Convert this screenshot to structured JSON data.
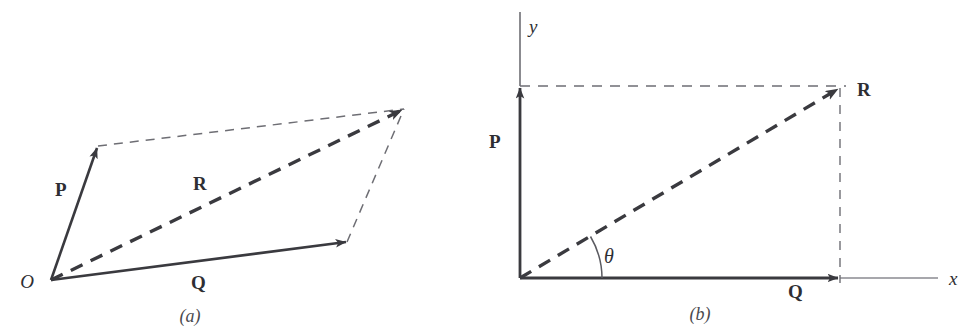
{
  "figure": {
    "background_color": "#ffffff",
    "ink_color": "#3a3a3f",
    "thin_ink_color": "#6e6e74",
    "width": 978,
    "height": 334
  },
  "panels": [
    {
      "id": "panel-a",
      "caption": "(a)",
      "caption_pos": {
        "x": 190,
        "y": 322
      },
      "description": "parallelogram law of vector addition",
      "origin_label": "O",
      "origin_label_pos": {
        "x": 27,
        "y": 288
      },
      "origin_point": {
        "x": 51,
        "y": 280
      },
      "vectors": [
        {
          "name": "P",
          "label": "P",
          "label_pos": {
            "x": 55,
            "y": 196
          },
          "style": "solid",
          "from": {
            "x": 51,
            "y": 280
          },
          "to": {
            "x": 98,
            "y": 146
          }
        },
        {
          "name": "Q",
          "label": "Q",
          "label_pos": {
            "x": 191,
            "y": 289
          },
          "style": "solid",
          "from": {
            "x": 51,
            "y": 280
          },
          "to": {
            "x": 347,
            "y": 242
          }
        },
        {
          "name": "R",
          "label": "R",
          "label_pos": {
            "x": 193,
            "y": 190
          },
          "style": "dashed-thick",
          "from": {
            "x": 51,
            "y": 280
          },
          "to": {
            "x": 404,
            "y": 109
          }
        }
      ],
      "construction_lines": [
        {
          "name": "p-to-resultant",
          "style": "dashed-thin",
          "from": {
            "x": 98,
            "y": 146
          },
          "to": {
            "x": 404,
            "y": 109
          }
        },
        {
          "name": "q-to-resultant",
          "style": "dashed-thin",
          "from": {
            "x": 347,
            "y": 242
          },
          "to": {
            "x": 404,
            "y": 109
          }
        }
      ]
    },
    {
      "id": "panel-b",
      "caption": "(b)",
      "caption_pos": {
        "x": 688,
        "y": 320
      },
      "description": "rectangular components of a vector",
      "origin_point": {
        "x": 520,
        "y": 278
      },
      "axes": [
        {
          "name": "y-axis",
          "label": "y",
          "label_pos": {
            "x": 528,
            "y": 32
          },
          "from": {
            "x": 520,
            "y": 278
          },
          "to": {
            "x": 520,
            "y": 12
          }
        },
        {
          "name": "x-axis",
          "label": "x",
          "label_pos": {
            "x": 950,
            "y": 285
          },
          "from": {
            "x": 520,
            "y": 278
          },
          "to": {
            "x": 938,
            "y": 278
          }
        }
      ],
      "vectors": [
        {
          "name": "P",
          "label": "P",
          "label_pos": {
            "x": 490,
            "y": 148
          },
          "style": "solid",
          "from": {
            "x": 520,
            "y": 278
          },
          "to": {
            "x": 520,
            "y": 86
          }
        },
        {
          "name": "Q",
          "label": "Q",
          "label_pos": {
            "x": 789,
            "y": 297
          },
          "style": "solid",
          "from": {
            "x": 520,
            "y": 278
          },
          "to": {
            "x": 840,
            "y": 278
          }
        },
        {
          "name": "R",
          "label": "R",
          "label_pos": {
            "x": 858,
            "y": 95
          },
          "style": "dashed-thick",
          "from": {
            "x": 520,
            "y": 278
          },
          "to": {
            "x": 840,
            "y": 88
          }
        }
      ],
      "construction_lines": [
        {
          "name": "horizontal-projection",
          "style": "dashed-thin",
          "from": {
            "x": 520,
            "y": 86
          },
          "to": {
            "x": 845,
            "y": 86
          }
        },
        {
          "name": "vertical-projection",
          "style": "dashed-thin",
          "from": {
            "x": 840,
            "y": 88
          },
          "to": {
            "x": 840,
            "y": 282
          }
        }
      ],
      "angle": {
        "name": "theta",
        "label": "θ",
        "label_pos": {
          "x": 604,
          "y": 262
        },
        "arc_radius": 82,
        "vertex": {
          "x": 520,
          "y": 278
        },
        "start_deg": 0,
        "end_deg": 30.7
      }
    }
  ]
}
